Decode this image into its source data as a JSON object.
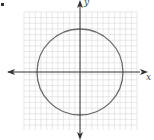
{
  "figure": {
    "bullet": "•",
    "axes": {
      "x_label": "x",
      "y_label": "y",
      "arrows": "both-directions"
    },
    "grid": {
      "left": 24,
      "top": 12,
      "right": 137,
      "bottom": 130,
      "cell": 5.65,
      "color": "#d9d9d9"
    },
    "circle": {
      "cx": 80,
      "cy": 72,
      "r": 43,
      "stroke": "#6b6b6b"
    },
    "origin": {
      "x": 80,
      "y": 72
    },
    "axis_color": "#333333"
  }
}
